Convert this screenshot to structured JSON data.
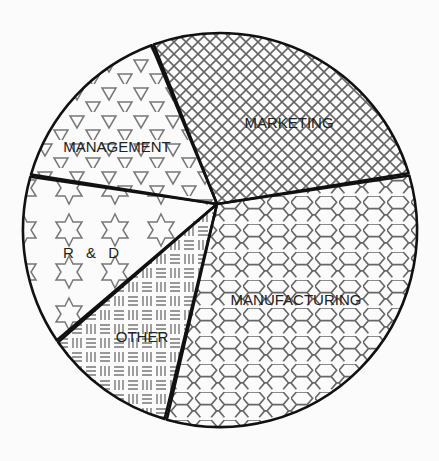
{
  "chart_data": {
    "type": "pie",
    "title": "",
    "slices": [
      {
        "label": "MARKETING",
        "value": 26,
        "pattern": "crosshatch"
      },
      {
        "label": "MANUFACTURING",
        "value": 34,
        "pattern": "hexagons"
      },
      {
        "label": "OTHER",
        "value": 11,
        "pattern": "basketweave"
      },
      {
        "label": "R & D",
        "value": 14,
        "pattern": "stars"
      },
      {
        "label": "MANAGEMENT",
        "value": 15,
        "pattern": "triangles"
      }
    ],
    "start_angle_deg": -110,
    "direction": "clockwise",
    "legend": "none",
    "labels_inside": true
  },
  "colors": {
    "background": "#fbfbfb",
    "outline": "#111111",
    "pattern": "#6a6a6a"
  }
}
